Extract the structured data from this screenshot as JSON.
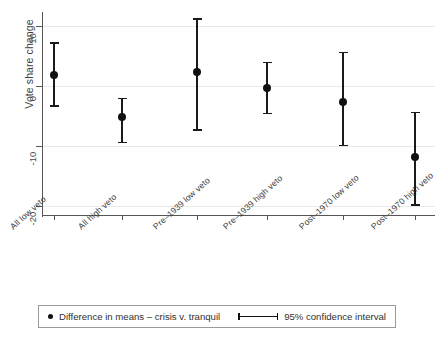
{
  "chart_data": {
    "type": "scatter",
    "title": "",
    "xlabel": "",
    "ylabel": "Vote share change",
    "ylim": [
      -22,
      12
    ],
    "yticks": [
      10,
      0,
      -10,
      -20
    ],
    "ytick_labels": [
      "10",
      "0",
      "-10",
      "-20"
    ],
    "grid": true,
    "categories": [
      "All low veto",
      "All high veto",
      "Pre–1939 low veto",
      "Pre–1939 high veto",
      "Post–1970 low veto",
      "Post–1970 high veto"
    ],
    "series": [
      {
        "name": "Difference in means – crisis v. tranquil",
        "values": [
          1.8,
          -5.2,
          2.3,
          -0.3,
          -2.7,
          -11.8
        ],
        "ci_low": [
          -3.2,
          -9.3,
          -7.2,
          -4.5,
          -9.8,
          -19.7
        ],
        "ci_high": [
          7.3,
          -2.0,
          11.3,
          4.0,
          5.7,
          -4.3
        ]
      }
    ],
    "legend": {
      "position": "bottom",
      "entries": [
        {
          "marker": "dot",
          "label": "Difference in means – crisis v. tranquil"
        },
        {
          "marker": "errorbar",
          "label": "95% confidence interval"
        }
      ]
    }
  },
  "axis": {
    "y_title": "Vote share change"
  }
}
